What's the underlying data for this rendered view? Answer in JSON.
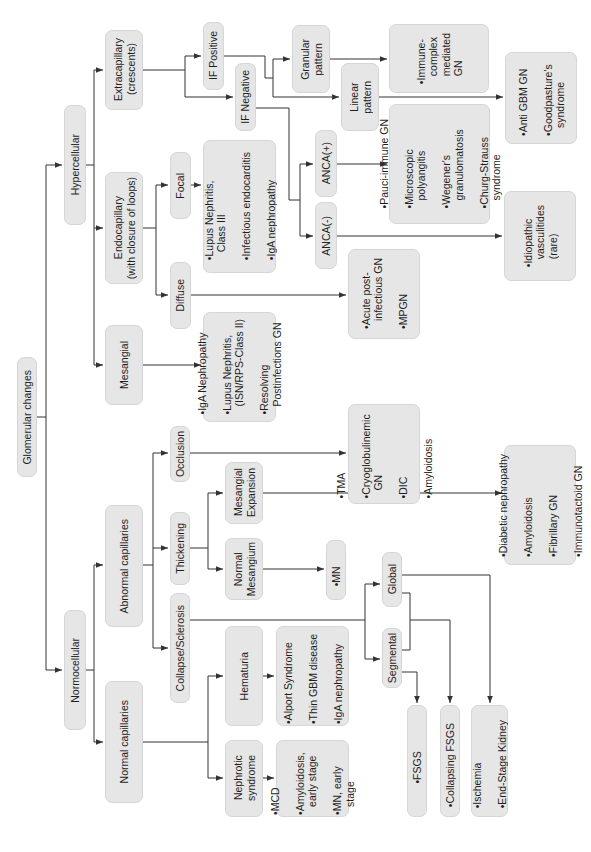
{
  "diagram": {
    "title": "Glomerular changes",
    "colors": {
      "box_fill": "#e6e6e6",
      "box_border": "#d6d6d6",
      "line": "#333333",
      "text": "#1e1e1e"
    },
    "nodes": {
      "root": "Glomerular changes",
      "hypercellular": "Hypercellular",
      "normocellular": "Normocellular",
      "extracapillary": "Extracapillary\n(crescents)",
      "endocapillary": "Endocapillary\n(with closure of loops)",
      "mesangial": "Mesangial",
      "abnormal_capillaries": "Abnormal capillaries",
      "normal_capillaries": "Normal capillaries",
      "if_positive": "IF Positive",
      "if_negative": "IF Negative",
      "granular_pattern": "Granular\npattern",
      "linear_pattern": "Linear\npattern",
      "focal": "Focal",
      "diffuse": "Diffuse",
      "anca_pos": "ANCA(+)",
      "anca_neg": "ANCA(-)",
      "occlusion": "Occlusion",
      "thickening": "Thickening",
      "collapse_sclerosis": "Collapse/Sclerosis",
      "mesangial_expansion": "Mesangial\nExpansion",
      "normal_mesangium": "Normal\nMesangium",
      "global": "Global",
      "segmental": "Segmental",
      "hematuria": "Hematuria",
      "nephrotic_syndrome": "Nephrotic\nsyndrome"
    },
    "outcomes": {
      "immune_complex": [
        "Immune-\ncomplex\nmediated\nGN"
      ],
      "anti_gbm": [
        "Anti GBM GN",
        "Goodpasture's\nsyndrome"
      ],
      "focal_list": [
        "Lupus Nephritis,\nClass III",
        "Infectious endocarditis",
        "IgA nephropathy"
      ],
      "pauci_immune": [
        "Pauci-immune GN",
        "Microscopic\npolyangitis",
        "Wegener's\ngranulomatosis",
        "Churg-Strauss\nsyndrome"
      ],
      "idiopathic": [
        "Idiopathic\nvasculitides\n(rare)"
      ],
      "diffuse_list": [
        "Acute post-\ninfectious GN",
        "MPGN"
      ],
      "mesangial_list": [
        "IgA Nephropathy",
        "Lupus Nephritis,\n(ISN/RPS-Class II)",
        "Resolving\nPostinfections GN"
      ],
      "occlusion_list": [
        "TMA",
        "Cryoglobulinemic\nGN",
        "DIC",
        "Amyloidosis"
      ],
      "mesangial_expansion_list": [
        "Diabetic nephropathy",
        "Amyloidosis",
        "Fibrillary GN",
        "Immunotactoid GN"
      ],
      "mn": [
        "MN"
      ],
      "hematuria_list": [
        "Alport Syndrome",
        "Thin GBM disease",
        "IgA nephropathy"
      ],
      "nephrotic_list": [
        "MCD",
        "Amyloidosis,\nearly stage",
        "MN, early\nstage"
      ],
      "fsgs": [
        "FSGS"
      ],
      "collapsing_fsgs": [
        "Collapsing FSGS"
      ],
      "ischemia": [
        "Ischemia",
        "End-Stage Kidney"
      ]
    }
  }
}
